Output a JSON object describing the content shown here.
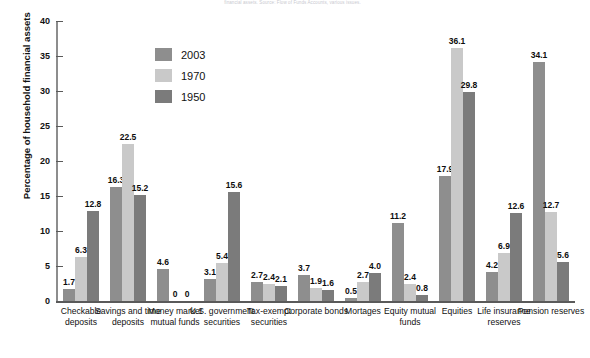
{
  "scan": {
    "header_artifact": "financial assets. Source: Flow of Funds Accounts, various issues."
  },
  "chart_data": {
    "type": "bar",
    "title": "",
    "xlabel": "",
    "ylabel": "Percentage of household financial assets",
    "ylim": [
      0,
      40
    ],
    "yticks": [
      0,
      5,
      10,
      15,
      20,
      25,
      30,
      35,
      40
    ],
    "grid": false,
    "legend_position": "upper-left-inside",
    "categories": [
      "Checkable deposits",
      "Savings and time deposits",
      "Money market mutual funds",
      "U.S. government securities",
      "Tax-exempt securities",
      "Corporate bonds",
      "Mortages",
      "Equity mutual funds",
      "Equities",
      "Life insurance reserves",
      "Pension reserves"
    ],
    "series": [
      {
        "name": "2003",
        "color": "#8e8e8e",
        "values": [
          1.7,
          16.3,
          4.6,
          3.1,
          2.7,
          3.7,
          0.5,
          11.2,
          17.9,
          4.2,
          34.1
        ],
        "labels": [
          "1.7",
          "16.3",
          "4.6",
          "3.1",
          "2.7",
          "3.7",
          "0.5",
          "11.2",
          "17.9",
          "4.2",
          "34.1"
        ]
      },
      {
        "name": "1970",
        "color": "#c9c9c9",
        "values": [
          6.3,
          22.5,
          0,
          5.4,
          2.4,
          1.9,
          2.7,
          2.4,
          36.1,
          6.9,
          12.7
        ],
        "labels": [
          "6.3",
          "22.5",
          "0",
          "5.4",
          "2.4",
          "1.9",
          "2.7",
          "2.4",
          "36.1",
          "6.9",
          "12.7"
        ]
      },
      {
        "name": "1950",
        "color": "#7b7b7b",
        "values": [
          12.8,
          15.2,
          0,
          15.6,
          2.1,
          1.6,
          4.0,
          0.8,
          29.8,
          12.6,
          5.6
        ],
        "labels": [
          "12.8",
          "15.2",
          "0",
          "15.6",
          "2.1",
          "1.6",
          "4.0",
          "0.8",
          "29.8",
          "12.6",
          "5.6"
        ]
      }
    ]
  },
  "legend": {
    "items": [
      {
        "label": "2003",
        "color": "#8e8e8e"
      },
      {
        "label": "1970",
        "color": "#c9c9c9"
      },
      {
        "label": "1950",
        "color": "#7b7b7b"
      }
    ]
  },
  "axis": {
    "y_title": "Percentage of household financial assets",
    "y_tick_labels": [
      "0",
      "5",
      "10",
      "15",
      "20",
      "25",
      "30",
      "35",
      "40"
    ]
  }
}
